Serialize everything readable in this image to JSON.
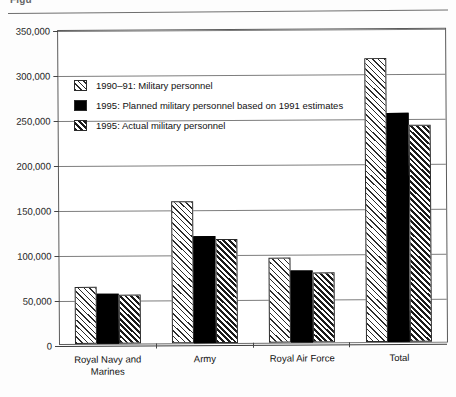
{
  "figure": {
    "title_visible_fragment": "Figu"
  },
  "chart_data": {
    "type": "bar",
    "title": "",
    "xlabel": "",
    "ylabel": "",
    "ylim": [
      0,
      350000
    ],
    "ytick_labels": [
      "350,000",
      "300,000",
      "250,000",
      "200,000",
      "150,000",
      "100,000",
      "50,000",
      "0"
    ],
    "ytick_values": [
      350000,
      300000,
      250000,
      200000,
      150000,
      100000,
      50000,
      0
    ],
    "grid": true,
    "legend_position": "upper-left-inside",
    "categories": [
      "Royal Navy and Marines",
      "Army",
      "Royal Air Force",
      "Total"
    ],
    "series": [
      {
        "name": "1990–91: Military personnel",
        "pattern": "light-diagonal-hatch",
        "values": [
          63000,
          158000,
          95000,
          316000
        ]
      },
      {
        "name": "1995: Planned military personnel based on 1991 estimates",
        "pattern": "solid-black",
        "values": [
          56000,
          119000,
          80000,
          254000
        ]
      },
      {
        "name": "1995: Actual military personnel",
        "pattern": "dark-diagonal-hatch",
        "values": [
          54000,
          116000,
          78000,
          241000
        ]
      }
    ]
  }
}
